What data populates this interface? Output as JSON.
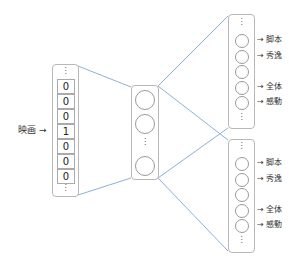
{
  "diagram": {
    "type": "neural-network-multitask",
    "input": {
      "label": "映画",
      "arrow": "→",
      "top_ellipsis": "⋮",
      "bottom_ellipsis": "⋮",
      "cells": [
        "0",
        "0",
        "0",
        "1",
        "0",
        "0",
        "0"
      ]
    },
    "hidden": {
      "node_count_visible": 3,
      "ellipsis": "⋮"
    },
    "outputs": [
      {
        "top_ellipsis": "⋮",
        "bottom_ellipsis": "⋮",
        "nodes": [
          {
            "label": "→ 脚本"
          },
          {
            "label": "→ 秀逸"
          },
          {
            "label": ""
          },
          {
            "label": "→ 全体"
          },
          {
            "label": "→ 感動"
          }
        ]
      },
      {
        "top_ellipsis": "⋮",
        "bottom_ellipsis": "⋮",
        "nodes": [
          {
            "label": "→ 脚本"
          },
          {
            "label": "→ 秀逸"
          },
          {
            "label": ""
          },
          {
            "label": "→ 全体"
          },
          {
            "label": "→ 感動"
          }
        ]
      }
    ],
    "colors": {
      "connection_line": "#8fb0d8",
      "box_border": "#b8b8b8",
      "node_border": "#999999"
    }
  }
}
